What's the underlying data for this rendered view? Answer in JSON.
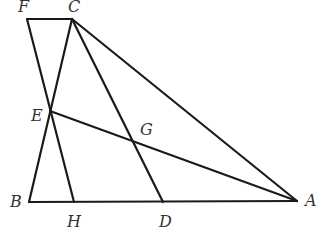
{
  "figure": {
    "type": "geometry",
    "stroke_color": "#1a1a1a",
    "label_color": "#333333",
    "points": {
      "F": {
        "x": 27,
        "y": 19,
        "label": "F",
        "lx": 18,
        "ly": 12
      },
      "C": {
        "x": 72,
        "y": 19,
        "label": "C",
        "lx": 68,
        "ly": 12
      },
      "E": {
        "x": 50,
        "y": 111,
        "label": "E",
        "lx": 31,
        "ly": 121
      },
      "G": {
        "x": 133,
        "y": 142,
        "label": "G",
        "lx": 140,
        "ly": 135
      },
      "B": {
        "x": 29,
        "y": 202,
        "label": "B",
        "lx": 10,
        "ly": 207
      },
      "H": {
        "x": 74,
        "y": 202,
        "label": "H",
        "lx": 67,
        "ly": 227
      },
      "D": {
        "x": 163,
        "y": 202,
        "label": "D",
        "lx": 159,
        "ly": 227
      },
      "A": {
        "x": 297,
        "y": 201,
        "label": "A",
        "lx": 305,
        "ly": 206
      }
    },
    "segments": [
      [
        "F",
        "C"
      ],
      [
        "F",
        "H"
      ],
      [
        "B",
        "C"
      ],
      [
        "B",
        "A"
      ],
      [
        "C",
        "A"
      ],
      [
        "C",
        "D"
      ],
      [
        "E",
        "A"
      ]
    ]
  }
}
